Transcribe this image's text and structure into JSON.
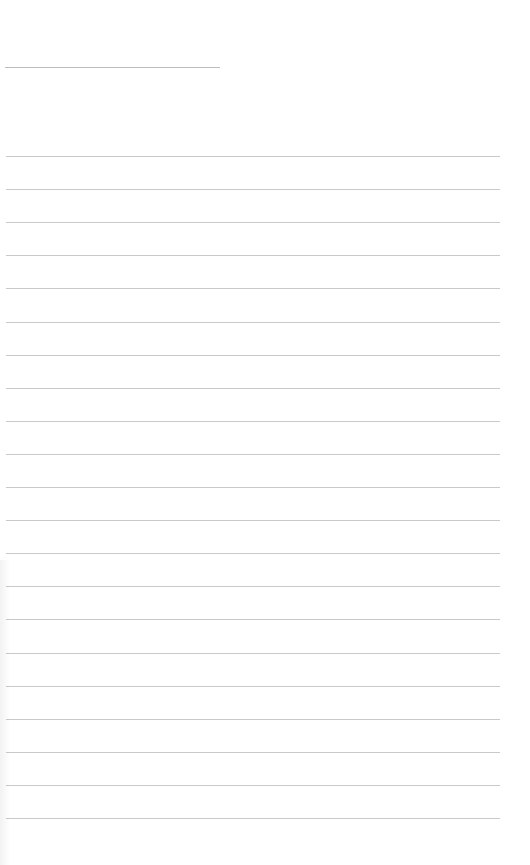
{
  "document": {
    "type": "lined-paper",
    "title_line": {
      "top": 67,
      "left": 5,
      "width": 215,
      "text": ""
    },
    "ruled_lines": {
      "count": 21,
      "first_top": 156,
      "spacing": 33.1,
      "left": 6,
      "width": 494,
      "color": "#c9c9c9"
    },
    "background_color": "#ffffff"
  }
}
